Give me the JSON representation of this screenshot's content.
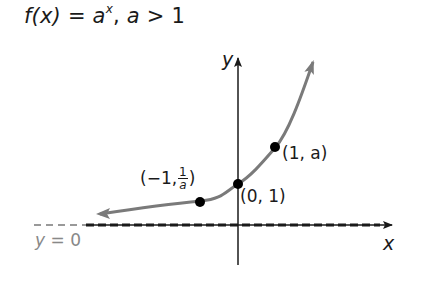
{
  "title": {
    "fx": "f(x)",
    "equals": "=",
    "base": "a",
    "exponent": "x",
    "condition_sep": ",",
    "condition_var": "a",
    "condition_op": ">",
    "condition_val": "1"
  },
  "axes": {
    "x_label": "x",
    "y_label": "y"
  },
  "asymptote": {
    "label_var": "y",
    "label_eq": "=",
    "label_val": "0"
  },
  "points": [
    {
      "id": "neg-one",
      "label_prefix": "(−1,",
      "frac_num": "1",
      "frac_den": "a",
      "label_suffix": ")"
    },
    {
      "id": "zero",
      "label": "(0, 1)"
    },
    {
      "id": "one",
      "label": "(1, a)"
    }
  ],
  "colors": {
    "curve": "#7a7a7a",
    "axis": "#1a1a1a",
    "asymptote_label": "#888888",
    "point": "#000000"
  }
}
